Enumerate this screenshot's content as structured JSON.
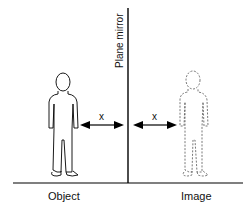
{
  "diagram": {
    "mirror_label": "Plane mirror",
    "object_label": "Object",
    "image_label": "Image",
    "distance_left": "x",
    "distance_right": "x"
  }
}
